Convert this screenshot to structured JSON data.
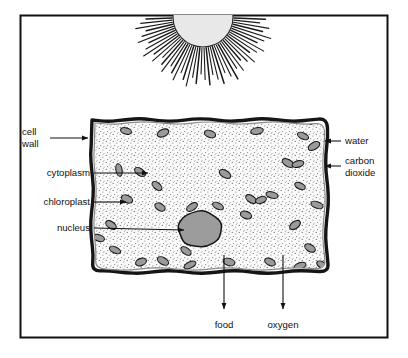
{
  "figure": {
    "frame": {
      "stroke": "#111111"
    },
    "background": "#ffffff"
  },
  "sun": {
    "name": "sun",
    "fill": "#e8e8e8",
    "stroke": "#222222",
    "ray_color": "#1a1a1a",
    "center_x": 203,
    "base_y": 17,
    "radius": 30,
    "ray_count": 46,
    "ray_inner": 31,
    "ray_outer": 64
  },
  "cell": {
    "name": "plant cell",
    "wall_outer_color": "#151515",
    "wall_inner_color": "#8a8a8a",
    "cytoplasm_fill": "#fbfbfb",
    "stipple_color": "#7a7a7a",
    "left": 92,
    "top": 120,
    "right": 327,
    "bottom": 272
  },
  "nucleus": {
    "name": "nucleus",
    "fill": "#9c9c9c",
    "stroke": "#141414",
    "cx": 200,
    "cy": 229,
    "rx": 22,
    "ry": 18
  },
  "chloroplast": {
    "name": "chloroplast",
    "fill": "#9a9a9a",
    "stroke": "#171717",
    "rx": 5.6,
    "ry": 3.1,
    "positions": [
      [
        126,
        131,
        15
      ],
      [
        163,
        133,
        -25
      ],
      [
        210,
        134,
        20
      ],
      [
        257,
        131,
        -10
      ],
      [
        303,
        136,
        25
      ],
      [
        310,
        119,
        70
      ],
      [
        140,
        172,
        35
      ],
      [
        157,
        186,
        40
      ],
      [
        119,
        170,
        80
      ],
      [
        127,
        199,
        25
      ],
      [
        160,
        207,
        30
      ],
      [
        192,
        207,
        -35
      ],
      [
        218,
        206,
        25
      ],
      [
        225,
        174,
        30
      ],
      [
        251,
        199,
        35
      ],
      [
        261,
        200,
        -20
      ],
      [
        272,
        195,
        15
      ],
      [
        246,
        215,
        20
      ],
      [
        288,
        163,
        30
      ],
      [
        298,
        164,
        -15
      ],
      [
        300,
        186,
        25
      ],
      [
        295,
        225,
        -35
      ],
      [
        310,
        248,
        30
      ],
      [
        317,
        205,
        20
      ],
      [
        115,
        250,
        25
      ],
      [
        141,
        262,
        -20
      ],
      [
        163,
        261,
        30
      ],
      [
        186,
        251,
        35
      ],
      [
        190,
        265,
        -25
      ],
      [
        229,
        262,
        15
      ],
      [
        270,
        262,
        25
      ],
      [
        300,
        266,
        -20
      ],
      [
        322,
        265,
        30
      ],
      [
        314,
        146,
        -30
      ],
      [
        111,
        225,
        35
      ],
      [
        99,
        238,
        20
      ]
    ]
  },
  "labels": {
    "cell_wall": {
      "text_lines": [
        "cell",
        "wall"
      ],
      "x": 22,
      "y": 132
    },
    "cytoplasm": {
      "text": "cytoplasm",
      "x": 90,
      "y": 173
    },
    "chloroplast": {
      "text": "chloroplast",
      "x": 90,
      "y": 202
    },
    "nucleus": {
      "text": "nucleus",
      "x": 90,
      "y": 228
    },
    "water": {
      "text": "water",
      "x": 345,
      "y": 141
    },
    "carbon_dioxide": {
      "text_lines": [
        "carbon",
        "dioxide"
      ],
      "x": 345,
      "y": 166
    },
    "food": {
      "text": "food",
      "x": 224,
      "y": 325
    },
    "oxygen": {
      "text": "oxygen",
      "x": 283,
      "y": 325
    }
  },
  "arrows": {
    "color": "#111111",
    "cell_wall": {
      "x1": 50,
      "y1": 138,
      "x2": 88,
      "y2": 138
    },
    "cytoplasm": {
      "x1": 94,
      "y1": 173,
      "x2": 148,
      "y2": 173
    },
    "chloroplast": {
      "x1": 94,
      "y1": 202,
      "x2": 126,
      "y2": 202
    },
    "nucleus": {
      "x1": 94,
      "y1": 228,
      "x2": 184,
      "y2": 230
    },
    "water": {
      "x1": 341,
      "y1": 141,
      "x2": 325,
      "y2": 141
    },
    "carbon_dioxide": {
      "x1": 341,
      "y1": 166,
      "x2": 325,
      "y2": 166
    },
    "food": {
      "x1": 224,
      "y1": 255,
      "x2": 224,
      "y2": 309
    },
    "oxygen": {
      "x1": 283,
      "y1": 255,
      "x2": 283,
      "y2": 309
    }
  }
}
